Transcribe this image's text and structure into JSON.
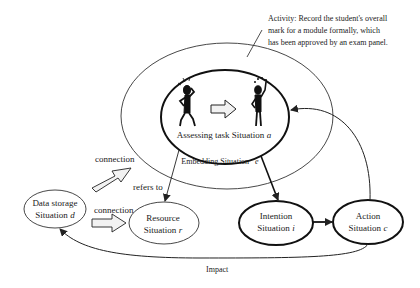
{
  "activity_note": {
    "lines": [
      "Activity: Record the student's overall",
      "mark for a module formally, which",
      "has been approved by an exam panel."
    ]
  },
  "nodes": {
    "assessing": {
      "label": "Assessing task Situation",
      "var": "a"
    },
    "embedding": {
      "label": "Embedding Situation",
      "var": "e"
    },
    "data_storage": {
      "line1": "Data storage",
      "line2": "Situation",
      "var": "d"
    },
    "resource": {
      "line1": "Resource",
      "line2": "Situation",
      "var": "r"
    },
    "intention": {
      "line1": "Intention",
      "line2": "Situation",
      "var": "i"
    },
    "action": {
      "line1": "Action",
      "line2": "Situation",
      "var": "c"
    }
  },
  "edges": {
    "connection_top": "connection",
    "connection_bottom": "connection",
    "refers_to": "refers to",
    "impact": "Impact"
  },
  "colors": {
    "stroke": "#222222",
    "fill_arrow": "#f2f2f2",
    "figure": "#111111"
  }
}
